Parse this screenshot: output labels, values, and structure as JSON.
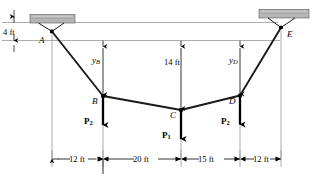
{
  "figure": {
    "type": "cable-with-concentrated-loads-free-body-diagram",
    "supports": [
      {
        "name": "support-block-left",
        "at_node": "A"
      },
      {
        "name": "support-block-right",
        "at_node": "E"
      }
    ],
    "nodes": [
      {
        "id": "A",
        "label": "A"
      },
      {
        "id": "B",
        "label": "B"
      },
      {
        "id": "C",
        "label": "C"
      },
      {
        "id": "D",
        "label": "D"
      },
      {
        "id": "E",
        "label": "E"
      }
    ],
    "vertical_dimensions": [
      {
        "id": "left-offset",
        "label": "4 ft",
        "value": 4,
        "unit": "ft"
      },
      {
        "id": "sag-B",
        "label": "y",
        "sub": "B"
      },
      {
        "id": "sag-C",
        "label": "14 ft",
        "value": 14,
        "unit": "ft"
      },
      {
        "id": "sag-D",
        "label": "y",
        "sub": "D"
      }
    ],
    "horizontal_dimensions": [
      {
        "id": "span-A-B",
        "label": "12 ft",
        "value": 12,
        "unit": "ft"
      },
      {
        "id": "span-B-C",
        "label": "20 ft",
        "value": 20,
        "unit": "ft"
      },
      {
        "id": "span-C-D",
        "label": "15 ft",
        "value": 15,
        "unit": "ft"
      },
      {
        "id": "span-D-E",
        "label": "12 ft",
        "value": 12,
        "unit": "ft"
      }
    ],
    "forces": [
      {
        "id": "force-at-B",
        "label": "P",
        "sub": "2",
        "at_node": "B",
        "direction": "down"
      },
      {
        "id": "force-at-C",
        "label": "P",
        "sub": "1",
        "at_node": "C",
        "direction": "down"
      },
      {
        "id": "force-at-D",
        "label": "P",
        "sub": "2",
        "at_node": "D",
        "direction": "down"
      }
    ],
    "colors": {
      "line": "#000000",
      "support_fill": "#b5b5b5",
      "support_stroke": "#555555",
      "thin_rule": "#7a7a7a",
      "extension_line": "#8a8a8a"
    }
  }
}
